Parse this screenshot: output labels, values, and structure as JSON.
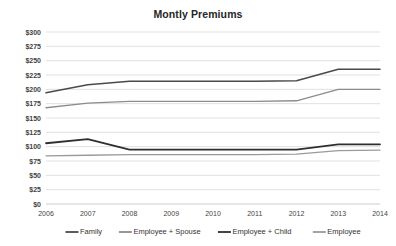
{
  "chart_data": {
    "type": "line",
    "title": "Montly Premiums",
    "xlabel": "",
    "ylabel": "",
    "grid": true,
    "legend_position": "bottom",
    "x": [
      2006,
      2007,
      2008,
      2009,
      2010,
      2011,
      2012,
      2013,
      2014
    ],
    "xtick_labels": [
      "2006",
      "2007",
      "2008",
      "2009",
      "2010",
      "2011",
      "2012",
      "2013",
      "2014"
    ],
    "ylim": [
      0,
      300
    ],
    "ytick_values": [
      300,
      275,
      250,
      225,
      200,
      175,
      150,
      125,
      100,
      75,
      50,
      25,
      0
    ],
    "ytick_labels": [
      "$300",
      "$275",
      "$250",
      "$225",
      "$200",
      "$175",
      "$150",
      "$125",
      "$100",
      "$75",
      "$50",
      "$25",
      "$0"
    ],
    "series": [
      {
        "name": "Family",
        "color": "#4a4a4a",
        "width": 1.5,
        "values": [
          194,
          208,
          214,
          214,
          214,
          214,
          215,
          235,
          235
        ]
      },
      {
        "name": "Employee + Spouse",
        "color": "#8c8c8c",
        "width": 1.4,
        "values": [
          168,
          176,
          179,
          179,
          179,
          179,
          180,
          200,
          200
        ]
      },
      {
        "name": "Employee + Child",
        "color": "#2f2f2f",
        "width": 1.8,
        "values": [
          106,
          113,
          95,
          95,
          95,
          95,
          95,
          104,
          104
        ]
      },
      {
        "name": "Employee",
        "color": "#9a9a9a",
        "width": 1.3,
        "values": [
          84,
          85,
          86,
          86,
          86,
          86,
          87,
          93,
          94
        ]
      }
    ]
  },
  "legend": {
    "items": [
      {
        "label": "Family",
        "color": "#4a4a4a"
      },
      {
        "label": "Employee + Spouse",
        "color": "#8c8c8c"
      },
      {
        "label": "Employee + Child",
        "color": "#2f2f2f"
      },
      {
        "label": "Employee",
        "color": "#9a9a9a"
      }
    ]
  },
  "layout": {
    "plot_left": 46,
    "plot_right": 380,
    "plot_top": 32,
    "plot_bottom": 204,
    "legend_y": 232
  }
}
